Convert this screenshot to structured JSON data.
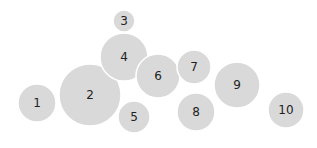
{
  "diagram": {
    "type": "packed-bubbles",
    "fill_color": "#d9d9d9",
    "label_color": "#222222",
    "bubbles": [
      {
        "label": "1",
        "cx": 37,
        "cy": 103,
        "r": 19
      },
      {
        "label": "2",
        "cx": 90,
        "cy": 95,
        "r": 31
      },
      {
        "label": "3",
        "cx": 124,
        "cy": 21,
        "r": 11
      },
      {
        "label": "4",
        "cx": 124,
        "cy": 57,
        "r": 24
      },
      {
        "label": "5",
        "cx": 134,
        "cy": 117,
        "r": 16
      },
      {
        "label": "6",
        "cx": 158,
        "cy": 76,
        "r": 22
      },
      {
        "label": "7",
        "cx": 194,
        "cy": 67,
        "r": 17
      },
      {
        "label": "8",
        "cx": 196,
        "cy": 112,
        "r": 19
      },
      {
        "label": "9",
        "cx": 237,
        "cy": 85,
        "r": 23
      },
      {
        "label": "10",
        "cx": 286,
        "cy": 110,
        "r": 18
      }
    ]
  }
}
